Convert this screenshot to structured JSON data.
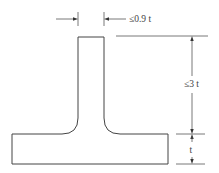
{
  "diagram": {
    "type": "tee-section-dimension-drawing",
    "labels": {
      "stem_width": "≤0.9 t",
      "stem_height": "≤3 t",
      "flange_thickness": "t"
    },
    "colors": {
      "outline": "#444444",
      "dimension": "#555555",
      "background": "#ffffff"
    }
  }
}
